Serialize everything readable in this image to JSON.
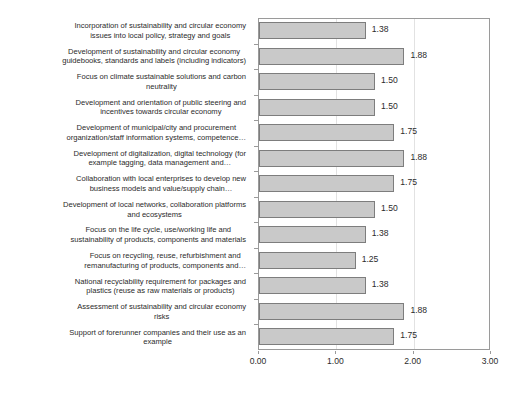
{
  "chart_data": {
    "type": "bar",
    "orientation": "horizontal",
    "title": "",
    "subtitle": "",
    "xlabel": "",
    "ylabel": "",
    "xlim": [
      0,
      3
    ],
    "xticks": [
      "0.00",
      "1.00",
      "2.00",
      "3.00"
    ],
    "xtick_values": [
      0,
      1,
      2,
      3
    ],
    "grid": "vertical-light",
    "legend": "none",
    "bar_color": "#c9c9c9",
    "bar_border_color": "#7d7d7d",
    "axis_color": "#9a9a9a",
    "text_color": "#2b2b2b",
    "categories": [
      "Incorporation of sustainability and circular economy\nissues into local policy, strategy and goals",
      "Development of sustainability and circular economy\nguidebooks, standards and labels (including indicators)",
      "Focus on climate sustainable solutions and carbon\nneutrality",
      "Development and orientation of public steering and\nincentives towards circular economy",
      "Development of municipal/city and procurement\norganization/staff information systems, competence…",
      "Development of digitalization, digital technology (for\nexample tagging, data management and…",
      "Collaboration with local enterprises to develop new\nbusiness models and value/supply chain…",
      "Development of local networks, collaboration platforms\nand ecosystems",
      "Focus on the life cycle, use/working life and\nsustainability of products, components and materials",
      "Focus on recycling, reuse, refurbishment and\nremanufacturing of products, components and…",
      "National recyclability requirement for packages and\nplastics (reuse as raw materials or products)",
      "Assessment of sustainability and circular economy\nrisks",
      "Support of forerunner companies and their use as an\nexample"
    ],
    "values": [
      1.38,
      1.88,
      1.5,
      1.5,
      1.75,
      1.88,
      1.75,
      1.5,
      1.38,
      1.25,
      1.38,
      1.88,
      1.75
    ],
    "value_labels": [
      "1.38",
      "1.88",
      "1.50",
      "1.50",
      "1.75",
      "1.88",
      "1.75",
      "1.50",
      "1.38",
      "1.25",
      "1.38",
      "1.88",
      "1.75"
    ]
  }
}
